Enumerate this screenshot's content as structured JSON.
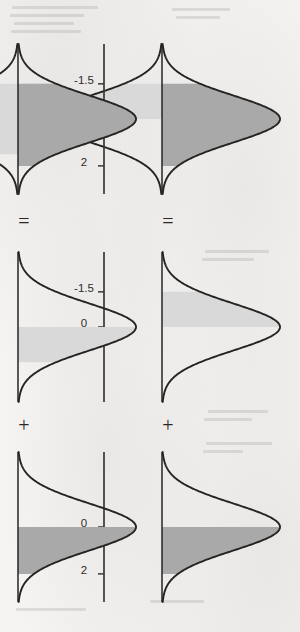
{
  "figure": {
    "orientation_degrees": 90,
    "background_color": "#f4f3f1",
    "curve_color": "#262422",
    "axis_color": "#3a3836",
    "shade_dark_color": "#a9a9a9",
    "shade_light_color": "#d9d9d9",
    "operators": {
      "plus": "+",
      "equals": "="
    },
    "rows": [
      {
        "row_id": "row-top",
        "panels": [
          {
            "panel_id": "top-left-result",
            "position": "left",
            "role": "result",
            "tick_labels": [
              "-1.5",
              "0",
              "2"
            ],
            "tick_values": [
              -1.5,
              0,
              2
            ],
            "mean": 0,
            "sd": 1,
            "shade_dark_from": -1.5,
            "shade_dark_to": 2,
            "shade_light_from": -1.5,
            "shade_light_to": 0,
            "shade_light_side": "below-baseline"
          },
          {
            "panel_id": "top-middle-component",
            "position": "middle",
            "role": "component",
            "tick_labels": [
              "-1.5",
              "0"
            ],
            "tick_values": [
              -1.5,
              0
            ],
            "mean": 0,
            "sd": 1,
            "shade_light_from": -1.5,
            "shade_light_to": 0
          },
          {
            "panel_id": "top-right-component",
            "position": "right",
            "role": "component",
            "tick_labels": [
              "0",
              "2"
            ],
            "tick_values": [
              0,
              2
            ],
            "mean": 0,
            "sd": 1,
            "shade_dark_from": 0,
            "shade_dark_to": 2
          }
        ],
        "operator_left": "=",
        "operator_right": "+"
      },
      {
        "row_id": "row-bottom",
        "panels": [
          {
            "panel_id": "bottom-left-result",
            "position": "left",
            "role": "result",
            "tick_labels": [
              "-1.5",
              "0",
              "2"
            ],
            "tick_values": [
              -1.5,
              0,
              2
            ],
            "mean": 0,
            "sd": 1,
            "shade_dark_from": -1.5,
            "shade_dark_to": 2,
            "shade_light_from": -1.5,
            "shade_light_to": 1.5,
            "shade_light_side": "below-baseline"
          },
          {
            "panel_id": "bottom-middle-component",
            "position": "middle",
            "role": "component",
            "tick_labels": [
              "0",
              "1.5"
            ],
            "tick_values": [
              0,
              1.5
            ],
            "mean": 0,
            "sd": 1,
            "shade_light_from": 0,
            "shade_light_to": 1.5
          },
          {
            "panel_id": "bottom-right-component",
            "position": "right",
            "role": "component",
            "tick_labels": [
              "0",
              "2"
            ],
            "tick_values": [
              0,
              2
            ],
            "mean": 0,
            "sd": 1,
            "shade_dark_from": 0,
            "shade_dark_to": 2
          }
        ],
        "operator_left": "=",
        "operator_right": "+"
      }
    ]
  },
  "chart_data": {
    "type": "area",
    "xlabel": "",
    "ylabel": "",
    "grid": false,
    "legend": "none",
    "xlim": [
      -3.2,
      3.2
    ],
    "ylim": [
      0,
      0.42
    ],
    "distribution": {
      "family": "normal",
      "mean": 0,
      "sd": 1
    },
    "panels": [
      {
        "id": "top-left-result",
        "ticks": [
          -1.5,
          0,
          2
        ],
        "tick_labels": [
          "-1.5",
          "0",
          "2"
        ],
        "shaded_regions": [
          {
            "from": -1.5,
            "to": 2,
            "shade": "dark",
            "area": 0.9104
          },
          {
            "from": -1.5,
            "to": 0,
            "shade": "light",
            "area": 0.4332
          }
        ]
      },
      {
        "id": "top-middle-component",
        "ticks": [
          -1.5,
          0
        ],
        "tick_labels": [
          "-1.5",
          "0"
        ],
        "shaded_regions": [
          {
            "from": -1.5,
            "to": 0,
            "shade": "light",
            "area": 0.4332
          }
        ]
      },
      {
        "id": "top-right-component",
        "ticks": [
          0,
          2
        ],
        "tick_labels": [
          "0",
          "2"
        ],
        "shaded_regions": [
          {
            "from": 0,
            "to": 2,
            "shade": "dark",
            "area": 0.4772
          }
        ]
      },
      {
        "id": "bottom-left-result",
        "ticks": [
          -1.5,
          0,
          2
        ],
        "tick_labels": [
          "-1.5",
          "0",
          "2"
        ],
        "shaded_regions": [
          {
            "from": -1.5,
            "to": 2,
            "shade": "dark",
            "area": 0.9104
          },
          {
            "from": -1.5,
            "to": 1.5,
            "shade": "light",
            "area": 0.8664
          }
        ]
      },
      {
        "id": "bottom-middle-component",
        "ticks": [
          0,
          1.5
        ],
        "tick_labels": [
          "0",
          "1.5"
        ],
        "shaded_regions": [
          {
            "from": 0,
            "to": 1.5,
            "shade": "light",
            "area": 0.4332
          }
        ]
      },
      {
        "id": "bottom-right-component",
        "ticks": [
          0,
          2
        ],
        "tick_labels": [
          "0",
          "2"
        ],
        "shaded_regions": [
          {
            "from": 0,
            "to": 2,
            "shade": "dark",
            "area": 0.4772
          }
        ]
      }
    ]
  }
}
